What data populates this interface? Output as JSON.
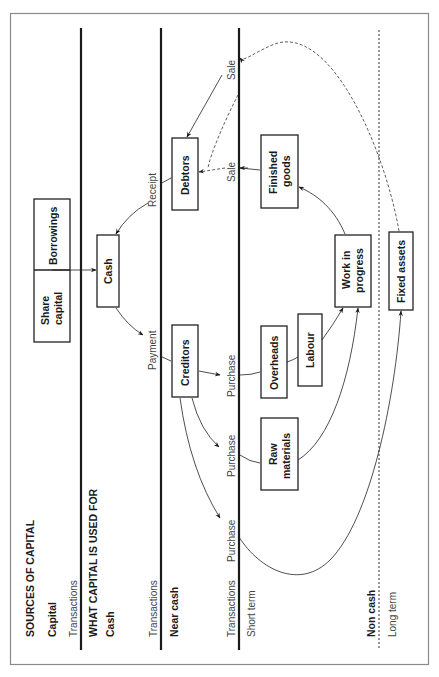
{
  "diagram": {
    "sections": {
      "sources": {
        "heading": "SOURCES OF CAPITAL",
        "row_label": "Capital",
        "transactions_label": "Transactions"
      },
      "uses": {
        "heading": "WHAT CAPITAL IS USED FOR",
        "cash_label": "Cash",
        "cash_transactions_label": "Transactions",
        "near_cash_label": "Near cash",
        "near_cash_transactions_label": "Transactions",
        "short_term_label": "Short term",
        "non_cash_label": "Non cash",
        "long_term_label": "Long term"
      }
    },
    "boxes": {
      "share_capital": [
        "Share",
        "capital"
      ],
      "borrowings": "Borrowings",
      "cash": "Cash",
      "debtors": "Debtors",
      "creditors": "Creditors",
      "finished_goods": [
        "Finished",
        "goods"
      ],
      "work_in_progress": [
        "Work in",
        "progress"
      ],
      "overheads": "Overheads",
      "labour": "Labour",
      "raw_materials": [
        "Raw",
        "materials"
      ],
      "fixed_assets": "Fixed assets"
    },
    "edge_labels": {
      "receipt": "Receipt",
      "payment": "Payment",
      "sale_finished": "Sale",
      "sale_fixed": "Sale",
      "purchase_overheads": "Purchase",
      "purchase_raw": "Purchase",
      "purchase_fixed": "Purchase"
    },
    "colors": {
      "line": "#1a1a1a",
      "frame": "#8a8a8a",
      "background": "#ffffff"
    }
  }
}
